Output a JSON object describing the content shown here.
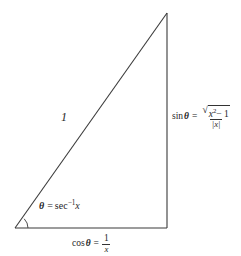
{
  "figure": {
    "background_color": "#ffffff",
    "stroke_color": "#3a3a3a",
    "canvas": {
      "width": 241,
      "height": 256
    }
  },
  "geometry": {
    "vertex_bottom_left": {
      "x": 15,
      "y": 228
    },
    "vertex_apex": {
      "x": 167,
      "y": 13
    },
    "vertex_bottom_right": {
      "x": 167,
      "y": 228
    },
    "angle_arc": {
      "center_x": 15,
      "center_y": 228,
      "radius": 13
    },
    "right_angle_marker": false
  },
  "labels": {
    "hypotenuse": "1",
    "angle": {
      "theta": "θ",
      "equals": "=",
      "function": "sec",
      "exponent": "−1",
      "argument": "x"
    },
    "opposite": {
      "function": "sin",
      "theta": "θ",
      "equals": "=",
      "radical_sign": "√",
      "numerator_base": "x",
      "numerator_exponent": "2",
      "numerator_tail": "− 1",
      "denominator": "|x|",
      "plain": "sin θ = √(x² − 1) / |x|"
    },
    "adjacent": {
      "function": "cos",
      "theta": "θ",
      "equals": "=",
      "numerator": "1",
      "denominator": "x",
      "plain": "cos θ = 1/x"
    }
  }
}
